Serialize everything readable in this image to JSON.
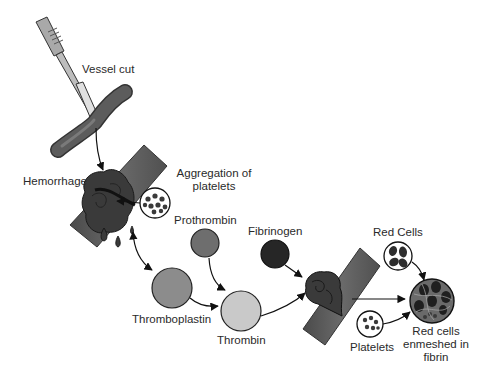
{
  "diagram": {
    "type": "coagulation-process-illustration",
    "labels": {
      "vessel_cut": "Vessel cut",
      "hemorrhage": "Hemorrhage",
      "aggregation_line1": "Aggregation of",
      "aggregation_line2": "platelets",
      "prothrombin": "Prothrombin",
      "fibrinogen": "Fibrinogen",
      "thromboplastin": "Thromboplastin",
      "thrombin": "Thrombin",
      "red_cells": "Red Cells",
      "platelets": "Platelets",
      "result_line1": "Red cells",
      "result_line2": "enmeshed in",
      "result_line3": "fibrin"
    },
    "nodes": [
      {
        "id": "scalpel",
        "icon": "scalpel-icon"
      },
      {
        "id": "vessel-cut",
        "icon": "blood-vessel-icon",
        "label": "Vessel cut"
      },
      {
        "id": "hemorrhage",
        "icon": "bleeding-vessel-icon",
        "label": "Hemorrhage"
      },
      {
        "id": "platelet-aggregation",
        "icon": "platelets-circle-icon",
        "label": "Aggregation of platelets"
      },
      {
        "id": "prothrombin",
        "shape": "circle",
        "fill": "#6e6e6e",
        "label": "Prothrombin"
      },
      {
        "id": "thromboplastin",
        "shape": "circle",
        "fill": "#8c8c8c",
        "label": "Thromboplastin"
      },
      {
        "id": "thrombin",
        "shape": "circle",
        "fill": "#c9c9c9",
        "label": "Thrombin"
      },
      {
        "id": "fibrinogen",
        "shape": "circle",
        "fill": "#262626",
        "label": "Fibrinogen"
      },
      {
        "id": "clotting-vessel",
        "icon": "clot-vessel-icon"
      },
      {
        "id": "red-cells",
        "icon": "red-cells-circle-icon",
        "label": "Red Cells"
      },
      {
        "id": "platelets",
        "icon": "platelets-circle-icon",
        "label": "Platelets"
      },
      {
        "id": "clot",
        "icon": "fibrin-clot-icon",
        "label": "Red cells enmeshed in fibrin"
      }
    ],
    "edges": [
      [
        "vessel-cut",
        "hemorrhage"
      ],
      [
        "platelet-aggregation",
        "hemorrhage"
      ],
      [
        "hemorrhage",
        "thromboplastin"
      ],
      [
        "thromboplastin",
        "thrombin"
      ],
      [
        "prothrombin",
        "thrombin"
      ],
      [
        "thrombin",
        "clotting-vessel"
      ],
      [
        "fibrinogen",
        "clotting-vessel"
      ],
      [
        "clotting-vessel",
        "clot"
      ],
      [
        "red-cells",
        "clot"
      ],
      [
        "platelets",
        "clot"
      ]
    ],
    "colors": {
      "vessel": "#5a5a5a",
      "vessel_dark": "#3a3a3a",
      "outline": "#1a1a1a",
      "prothrombin": "#6e6e6e",
      "thromboplastin": "#8c8c8c",
      "thrombin": "#c9c9c9",
      "fibrinogen": "#262626",
      "background": "#ffffff"
    }
  }
}
